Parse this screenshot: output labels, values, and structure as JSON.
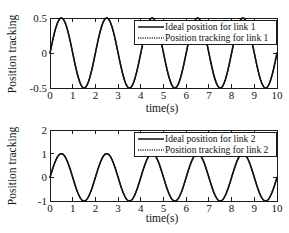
{
  "figure": {
    "background_color": "#ffffff",
    "line_color": "#111111",
    "panel_count": 2
  },
  "chart_data": [
    {
      "type": "line",
      "panel": "top",
      "title": "",
      "xlabel": "time(s)",
      "ylabel": "Position tracking",
      "xlim": [
        0,
        10
      ],
      "ylim": [
        -0.5,
        0.5
      ],
      "xticks": [
        0,
        1,
        2,
        3,
        4,
        5,
        6,
        7,
        8,
        9,
        10
      ],
      "xticklabels": [
        "0",
        "1",
        "2",
        "3",
        "4",
        "5",
        "6",
        "7",
        "8",
        "9",
        "10"
      ],
      "yticks": [
        -0.5,
        0,
        0.5
      ],
      "yticklabels": [
        "-0.5",
        "0",
        "0.5"
      ],
      "grid": false,
      "legend_position": "upper center right",
      "waveform": {
        "shape": "sine",
        "amplitude": 0.5,
        "period_s": 2.0,
        "phase_deg": 0,
        "offset": 0,
        "cycles": 5,
        "first_peak_time_s": 0.5,
        "first_trough_time_s": 1.5
      },
      "series": [
        {
          "name": "Ideal position for link 1",
          "style": "solid",
          "color": "#111111"
        },
        {
          "name": "Position tracking for link 1",
          "style": "dotted",
          "color": "#111111"
        }
      ]
    },
    {
      "type": "line",
      "panel": "bottom",
      "title": "",
      "xlabel": "time(s)",
      "ylabel": "Position tracking",
      "xlim": [
        0,
        10
      ],
      "ylim": [
        -1,
        2
      ],
      "xticks": [
        0,
        1,
        2,
        3,
        4,
        5,
        6,
        7,
        8,
        9,
        10
      ],
      "xticklabels": [
        "0",
        "1",
        "2",
        "3",
        "4",
        "5",
        "6",
        "7",
        "8",
        "9",
        "10"
      ],
      "yticks": [
        -1,
        0,
        1,
        2
      ],
      "yticklabels": [
        "-1",
        "0",
        "1",
        "2"
      ],
      "grid": false,
      "legend_position": "upper center right",
      "waveform": {
        "shape": "sine",
        "amplitude": 1.0,
        "period_s": 2.0,
        "phase_deg": 0,
        "offset": 0,
        "cycles": 5,
        "first_peak_time_s": 0.5,
        "first_trough_time_s": 1.5
      },
      "series": [
        {
          "name": "Ideal position for link 2",
          "style": "solid",
          "color": "#111111"
        },
        {
          "name": "Position tracking for link 2",
          "style": "dotted",
          "color": "#111111"
        }
      ]
    }
  ]
}
